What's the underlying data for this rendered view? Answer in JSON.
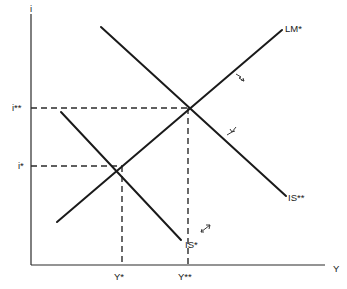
{
  "diagram": {
    "type": "IS-LM shift diagram",
    "axes": {
      "x_label": "Y",
      "y_label": "i"
    },
    "curves": [
      {
        "id": "LM-star",
        "label": "LM*",
        "slope": "upward"
      },
      {
        "id": "IS-star",
        "label": "IS*",
        "slope": "downward"
      },
      {
        "id": "IS-double-star",
        "label": "IS**",
        "slope": "downward"
      }
    ],
    "equilibria": [
      {
        "id": "e1",
        "interest_label": "i*",
        "output_label": "Y*",
        "curves": [
          "LM*",
          "IS*"
        ]
      },
      {
        "id": "e2",
        "interest_label": "i**",
        "output_label": "Y**",
        "curves": [
          "LM*",
          "IS**"
        ]
      }
    ],
    "shift_arrows": [
      {
        "on": "LM*",
        "direction": "down-right"
      },
      {
        "on": "IS**",
        "direction": "down-left"
      },
      {
        "on": "IS*",
        "direction": "up-right"
      }
    ]
  },
  "labels": {
    "y_axis": "i",
    "x_axis": "Y",
    "lm_star": "LM*",
    "is_star": "IS*",
    "is_double_star": "IS**",
    "i_star": "i*",
    "i_double_star": "i**",
    "y_star": "Y*",
    "y_double_star": "Y**"
  }
}
